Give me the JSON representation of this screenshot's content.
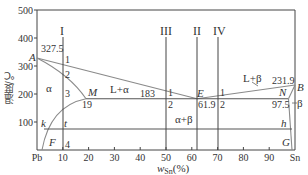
{
  "chart_data": {
    "type": "phase-diagram",
    "title": "",
    "xlabel": "w_Sn(%)",
    "xlabel_main": "w",
    "xlabel_sub": "Sn",
    "xlabel_unit": "(%)",
    "ylabel": "温度/℃",
    "xlim": [
      0,
      100
    ],
    "ylim": [
      0,
      500
    ],
    "x_ticks": [
      "Pb",
      "10",
      "20",
      "30",
      "40",
      "50",
      "60",
      "70",
      "80",
      "90",
      "Sn"
    ],
    "y_ticks": [
      "100",
      "200",
      "300",
      "400",
      "500"
    ],
    "points": {
      "A": {
        "x": 0,
        "y": 327.5,
        "label": "A"
      },
      "B": {
        "x": 100,
        "y": 231.9,
        "label": "B"
      },
      "E": {
        "x": 61.9,
        "y": 183,
        "label": "E"
      },
      "M": {
        "x": 19,
        "y": 183,
        "label": "M"
      },
      "N": {
        "x": 97.5,
        "y": 183,
        "label": "N"
      },
      "F": {
        "x": 2,
        "y": 0,
        "label": "F"
      },
      "G": {
        "x": 99,
        "y": 0,
        "label": "G"
      },
      "k": {
        "x": 3,
        "y": 75,
        "label": "k"
      },
      "t": {
        "x": 10,
        "y": 75,
        "label": "t"
      },
      "h": {
        "x": 98.8,
        "y": 75,
        "label": "h"
      }
    },
    "value_labels": {
      "A_temp": "327.5",
      "B_temp": "231.9",
      "eutectic_temp": "183",
      "M_comp": "19",
      "E_comp": "61.9",
      "N_comp": "97.5"
    },
    "regions": {
      "alpha": "α",
      "beta": "β",
      "L_alpha": "L+α",
      "L_beta": "L+β",
      "alpha_beta": "α+β"
    },
    "alloy_lines": [
      {
        "name": "I",
        "x": 10,
        "points": [
          "1",
          "2",
          "3",
          "4"
        ]
      },
      {
        "name": "III",
        "x": 50,
        "points": [
          "1",
          "2"
        ]
      },
      {
        "name": "II",
        "x": 61.9,
        "points": []
      },
      {
        "name": "IV",
        "x": 70,
        "points": [
          "1",
          "2"
        ]
      }
    ],
    "lines": {
      "liquidus_AE": [
        [
          0,
          327.5
        ],
        [
          61.9,
          183
        ]
      ],
      "liquidus_EB": [
        [
          61.9,
          183
        ],
        [
          100,
          231.9
        ]
      ],
      "solidus_AM": [
        [
          0,
          327.5
        ],
        [
          19,
          183
        ]
      ],
      "solidus_BN": [
        [
          100,
          231.9
        ],
        [
          97.5,
          183
        ]
      ],
      "eutectic_MN": [
        [
          19,
          183
        ],
        [
          97.5,
          183
        ]
      ],
      "solvus_MF": [
        [
          19,
          183
        ],
        [
          2,
          0
        ]
      ],
      "solvus_NG": [
        [
          97.5,
          183
        ],
        [
          99,
          0
        ]
      ],
      "isotherm_kh": [
        [
          3,
          75
        ],
        [
          98.8,
          75
        ]
      ]
    },
    "colors": {
      "axis": "#333333",
      "curve": "#8a8a8a",
      "text": "#333333"
    }
  }
}
